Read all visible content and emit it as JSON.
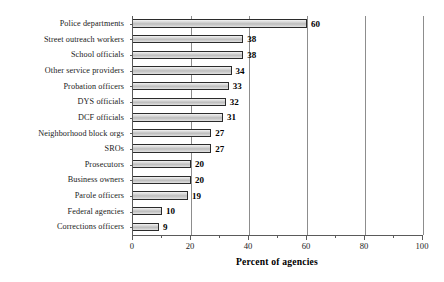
{
  "chart_data": {
    "type": "bar",
    "orientation": "horizontal",
    "title": "",
    "xlabel": "Percent of agencies",
    "ylabel": "",
    "xlim": [
      0,
      100
    ],
    "xticks": [
      0,
      20,
      40,
      60,
      80,
      100
    ],
    "xtick_labels": [
      "0",
      "20",
      "40",
      "60",
      "80",
      "100"
    ],
    "minor_tick_interval": 10,
    "grid": "vertical",
    "legend": "none",
    "show_value_labels": true,
    "categories": [
      "Police departments",
      "Street outreach workers",
      "School officials",
      "Other service providers",
      "Probation officers",
      "DYS officials",
      "DCF officials",
      "Neighborhood block orgs",
      "SROs",
      "Prosecutors",
      "Business owners",
      "Parole officers",
      "Federal agencies",
      "Corrections officers"
    ],
    "values": [
      60,
      38,
      38,
      34,
      33,
      32,
      31,
      27,
      27,
      20,
      20,
      19,
      10,
      9
    ],
    "value_labels": [
      "60",
      "38",
      "38",
      "34",
      "33",
      "32",
      "31",
      "27",
      "27",
      "20",
      "20",
      "19",
      "10",
      "9"
    ],
    "colors": {
      "bar_fill_light": "#f2f2f2",
      "bar_fill_mid": "#bdbdbd",
      "bar_edge": "#2b2b2b",
      "gridline": "#8d8d8d",
      "axis": "#5a5a5a",
      "text": "#000000",
      "background": "#ffffff"
    }
  }
}
